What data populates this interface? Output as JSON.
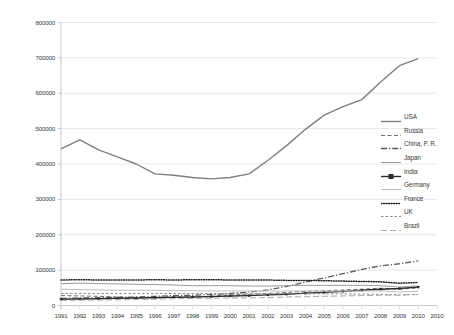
{
  "chart_data": {
    "type": "line",
    "title": "",
    "xlabel": "",
    "ylabel": "",
    "grid": true,
    "legend_position": "right",
    "ylim": [
      0,
      800000
    ],
    "ytick_labels": [
      "800000",
      "700000",
      "600000",
      "500000",
      "400000",
      "300000",
      "200000",
      "100000",
      "0"
    ],
    "ytick_values": [
      800000,
      700000,
      600000,
      500000,
      400000,
      300000,
      200000,
      100000,
      0
    ],
    "x": [
      1991,
      1992,
      1993,
      1994,
      1995,
      1996,
      1997,
      1998,
      1999,
      2000,
      2001,
      2002,
      2003,
      2004,
      2005,
      2006,
      2007,
      2008,
      2009,
      2010
    ],
    "xtick_labels": [
      "1991",
      "1992",
      "1993",
      "1994",
      "1995",
      "1996",
      "1997",
      "1998",
      "1999",
      "2000",
      "2001",
      "2002",
      "2003",
      "2004",
      "2005",
      "2006",
      "2007",
      "2008",
      "2009",
      "2010",
      "2010"
    ],
    "series": [
      {
        "name": "USA",
        "style": "solid",
        "color": "#7f7f7f",
        "width": 1.4,
        "marker": "none",
        "values": [
          443000,
          468000,
          440000,
          420000,
          400000,
          372000,
          368000,
          362000,
          358000,
          362000,
          372000,
          410000,
          452000,
          498000,
          538000,
          562000,
          582000,
          632000,
          678000,
          698000
        ]
      },
      {
        "name": "Russia",
        "style": "dashed",
        "color": "#6e6e6e",
        "width": 1.0,
        "marker": "none",
        "values": [
          28000,
          27000,
          26000,
          24000,
          22000,
          23000,
          25000,
          24000,
          26000,
          30000,
          32000,
          34000,
          37000,
          40000,
          42000,
          44000,
          46000,
          49000,
          46000,
          50000
        ]
      },
      {
        "name": "China, P. R.",
        "style": "dashdot",
        "color": "#5a5a5a",
        "width": 1.3,
        "marker": "none",
        "values": [
          20000,
          21000,
          22000,
          23000,
          24000,
          26000,
          28000,
          29000,
          31000,
          34000,
          38000,
          44000,
          54000,
          66000,
          78000,
          90000,
          102000,
          112000,
          118000,
          126000
        ]
      },
      {
        "name": "Japan",
        "style": "solid",
        "color": "#9a9a9a",
        "width": 1.0,
        "marker": "none",
        "values": [
          62000,
          63000,
          62000,
          61000,
          60000,
          59000,
          58000,
          56000,
          56000,
          56000,
          55000,
          55000,
          56000,
          57000,
          57000,
          57000,
          57000,
          56000,
          52000,
          55000
        ]
      },
      {
        "name": "India",
        "style": "solid",
        "color": "#2b2b2b",
        "width": 1.4,
        "marker": "square",
        "values": [
          18000,
          18500,
          19000,
          20000,
          21000,
          22000,
          23000,
          24000,
          25000,
          27000,
          28000,
          30000,
          32000,
          35000,
          37000,
          40000,
          43000,
          46000,
          48000,
          52000
        ]
      },
      {
        "name": "Germany",
        "style": "solid",
        "color": "#bdbdbd",
        "width": 1.0,
        "marker": "none",
        "values": [
          46000,
          45000,
          44000,
          43000,
          43000,
          43000,
          42000,
          42000,
          41000,
          41000,
          41000,
          41000,
          41000,
          41000,
          41000,
          41000,
          41000,
          41000,
          38000,
          40000
        ]
      },
      {
        "name": "France",
        "style": "dotted",
        "color": "#1f1f1f",
        "width": 1.5,
        "marker": "none",
        "values": [
          72000,
          73000,
          72000,
          72000,
          72000,
          73000,
          72000,
          73000,
          73000,
          72000,
          72000,
          72000,
          71000,
          71000,
          70000,
          69000,
          68000,
          67000,
          63000,
          65000
        ]
      },
      {
        "name": "UK",
        "style": "dashed-fine",
        "color": "#8d8d8d",
        "width": 1.0,
        "marker": "none",
        "values": [
          34000,
          34000,
          34000,
          34000,
          34000,
          34000,
          34000,
          34000,
          34000,
          33000,
          33000,
          33000,
          33000,
          33000,
          33000,
          33000,
          32000,
          32000,
          30000,
          31000
        ]
      },
      {
        "name": "Brazil",
        "style": "dashed-long",
        "color": "#a8a8a8",
        "width": 1.0,
        "marker": "none",
        "values": [
          14000,
          15000,
          15500,
          16000,
          17000,
          18000,
          19000,
          20000,
          20500,
          21000,
          21500,
          22500,
          24000,
          25000,
          26000,
          27000,
          28000,
          29000,
          29500,
          31000
        ]
      }
    ]
  },
  "axis": {
    "left_label_color": "#3a3a3a",
    "gridline_color": "#d9d9d9"
  }
}
